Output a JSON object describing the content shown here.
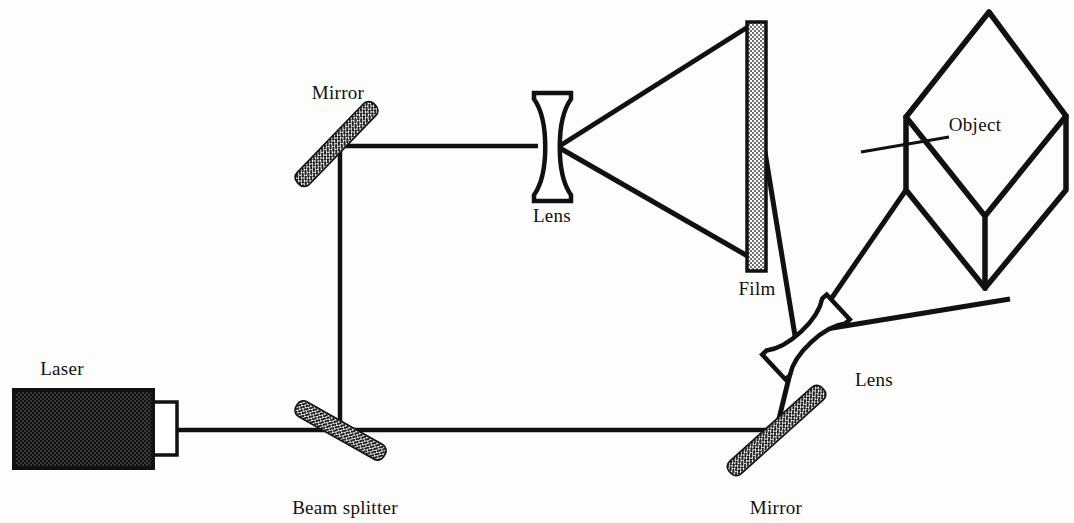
{
  "figure": {
    "background_color": "#fdfdfb",
    "ink_color": "#111111",
    "width": 1074,
    "height": 523
  },
  "labels": {
    "laser": "Laser",
    "mirror_top": "Mirror",
    "lens_top": "Lens",
    "film": "Film",
    "object": "Object",
    "lens_right": "Lens",
    "mirror_bottom": "Mirror",
    "beam_splitter": "Beam splitter"
  },
  "components": {
    "laser": {
      "name": "Laser",
      "body": {
        "x": 14,
        "y": 390,
        "width": 138,
        "height": 78
      },
      "aperture": {
        "x": 152,
        "y": 402,
        "width": 24,
        "height": 53
      },
      "fill": "dither-dark",
      "fill_color": "#2a2a2a"
    },
    "beam_splitter": {
      "name": "Beam splitter",
      "from": [
        317,
        472
      ],
      "to": [
        364,
        389
      ],
      "thickness": 13,
      "fill": "dither-dark"
    },
    "mirror_top": {
      "name": "Mirror",
      "from": [
        297,
        185
      ],
      "to": [
        376,
        103
      ],
      "thickness": 13,
      "fill": "dither-dark"
    },
    "mirror_bottom": {
      "name": "Mirror",
      "from": [
        731,
        471
      ],
      "to": [
        822,
        390
      ],
      "thickness": 13,
      "fill": "dither-dark"
    },
    "lens_top": {
      "name": "Lens",
      "type": "biconcave",
      "center": [
        552,
        147
      ],
      "width": 38,
      "height": 112,
      "rotation_deg": 0
    },
    "lens_right": {
      "name": "Lens",
      "type": "biconcave",
      "center": [
        806,
        337
      ],
      "width": 34,
      "height": 92,
      "rotation_deg": 48
    },
    "film": {
      "name": "Film",
      "x": 747,
      "y": 22,
      "width": 18,
      "height": 249,
      "fill": "dither-light"
    },
    "object": {
      "name": "Object",
      "type": "cube-isometric",
      "top_face": [
        [
          989,
          11
        ],
        [
          1066,
          115
        ],
        [
          985,
          215
        ],
        [
          906,
          116
        ]
      ],
      "front_left_face": [
        [
          906,
          116
        ],
        [
          985,
          215
        ],
        [
          985,
          287
        ],
        [
          906,
          190
        ]
      ],
      "front_right_face": [
        [
          985,
          215
        ],
        [
          1066,
          115
        ],
        [
          1066,
          190
        ],
        [
          985,
          287
        ]
      ]
    }
  },
  "beam_paths": {
    "laser_to_splitter": {
      "from": [
        176,
        430
      ],
      "to": [
        340,
        430
      ]
    },
    "splitter_to_right_mirror": {
      "from": [
        340,
        430
      ],
      "to": [
        776,
        430
      ]
    },
    "splitter_up": {
      "from": [
        340,
        430
      ],
      "to": [
        340,
        146
      ]
    },
    "corner_to_lens_top": {
      "from": [
        340,
        146
      ],
      "to": [
        536,
        146
      ]
    },
    "lens_top_fan_upper": {
      "from": [
        558,
        147
      ],
      "to": [
        750,
        25
      ]
    },
    "lens_top_fan_lower": {
      "from": [
        558,
        147
      ],
      "to": [
        750,
        258
      ]
    },
    "right_mirror_to_lens": {
      "from": [
        776,
        430
      ],
      "to": [
        793,
        355
      ]
    },
    "lens_right_fan_to_film": {
      "from": [
        800,
        345
      ],
      "to": [
        764,
        152
      ]
    },
    "lens_right_fan_to_object": {
      "from": [
        818,
        330
      ],
      "to": [
        1008,
        300
      ]
    },
    "object_edge_ray_upper": {
      "from": [
        862,
        152
      ],
      "to": [
        953,
        136
      ]
    },
    "object_edge_ray_lower": {
      "from": [
        790,
        350
      ],
      "to": [
        900,
        195
      ]
    }
  },
  "label_positions": {
    "laser": [
      62,
      375
    ],
    "mirror_top": [
      305,
      99
    ],
    "lens_top": [
      527,
      222
    ],
    "film": [
      738,
      294
    ],
    "object": [
      947,
      130
    ],
    "lens_right": [
      848,
      385
    ],
    "mirror_bottom": [
      730,
      513
    ],
    "beam_splitter": [
      285,
      513
    ]
  }
}
